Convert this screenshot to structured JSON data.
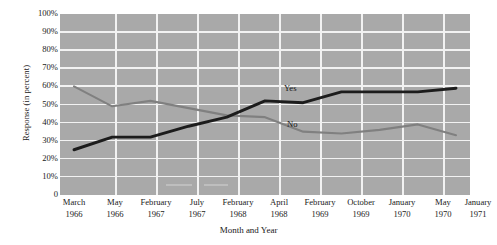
{
  "chart_data": {
    "type": "line",
    "title": "",
    "xlabel": "Month and Year",
    "ylabel": "Response (in percent)",
    "ylim": [
      0,
      100
    ],
    "ytick_labels": [
      "100%",
      "90%",
      "80%",
      "70%",
      "60%",
      "50%",
      "40%",
      "30%",
      "20%",
      "10%",
      "0"
    ],
    "ytick_values": [
      100,
      90,
      80,
      70,
      60,
      50,
      40,
      30,
      20,
      10,
      0
    ],
    "grid": true,
    "legend_position": "inline-labels",
    "categories": [
      "March 1966",
      "May 1966",
      "February 1967",
      "July 1967",
      "February 1968",
      "April 1968",
      "February 1969",
      "October 1969",
      "January 1970",
      "May 1970",
      "January 1971"
    ],
    "x_tick_months": [
      "March",
      "May",
      "February",
      "July",
      "February",
      "April",
      "February",
      "October",
      "January",
      "May",
      "January"
    ],
    "x_tick_years": [
      "1966",
      "1966",
      "1967",
      "1967",
      "1968",
      "1968",
      "1969",
      "1969",
      "1970",
      "1970",
      "1971"
    ],
    "series": [
      {
        "name": "Yes",
        "color": "#1c1c1c",
        "values": [
          25,
          32,
          32,
          38,
          43,
          52,
          51,
          57,
          57,
          57,
          59
        ]
      },
      {
        "name": "No",
        "color": "#808080",
        "values": [
          60,
          49,
          52,
          48,
          44,
          43,
          35,
          34,
          36,
          39,
          33
        ]
      }
    ],
    "annotations": [
      {
        "text": "Yes",
        "series": "Yes"
      },
      {
        "text": "No",
        "series": "No"
      }
    ],
    "plot_background_color": "#a9a9a9",
    "gridline_color": "#f2f2f2"
  }
}
